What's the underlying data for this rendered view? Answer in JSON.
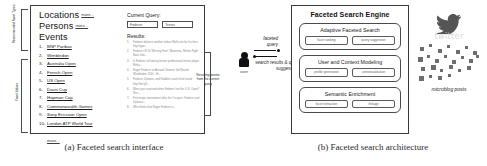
{
  "figure": {
    "caption_a": "(a) Faceted search interface",
    "caption_b": "(b) Faceted search architecture"
  },
  "interface": {
    "annotations": {
      "facet_types": "Recommended Facet Types",
      "facet_values": "Facet Values",
      "results_callout": "Resulting tweets from the current query"
    },
    "facets": [
      {
        "label": "Locations",
        "more": "more..."
      },
      {
        "label": "Persons",
        "more": "more..."
      },
      {
        "label": "Events",
        "more": ""
      }
    ],
    "events": [
      {
        "n": "1-",
        "label": "BNP Paribas"
      },
      {
        "n": "2-",
        "label": "Wimbledon"
      },
      {
        "n": "3-",
        "label": "Australia Open"
      },
      {
        "n": "4-",
        "label": "French Open"
      },
      {
        "n": "5-",
        "label": "US Open"
      },
      {
        "n": "6-",
        "label": "Davis Cup"
      },
      {
        "n": "7-",
        "label": "Hopman Cup"
      },
      {
        "n": "8-",
        "label": "Commonwealth Games"
      },
      {
        "n": "9-",
        "label": "Sony Ericsson Open"
      },
      {
        "n": "10-",
        "label": "London ATP World Tour"
      }
    ],
    "events_more": "more...",
    "query": {
      "title": "Current Query:",
      "chips": [
        "Federer",
        "Tennis"
      ]
    },
    "results": {
      "title": "Results:",
      "items": [
        {
          "n": "1.",
          "text": "Federer delivers another Indian Wells win for his fans http://goo..."
        },
        {
          "n": "2.",
          "text": "Federer Off To Winning Start; Wawrinka, Melzer Fight Back Into..."
        },
        {
          "n": "3.",
          "text": "Is Federer still dating former professional tennis player Mirka..."
        },
        {
          "n": "4.",
          "text": "Roger Federer vs Arnaud Clement 3rd Round. Wimbledon 2010 - Hi..."
        },
        {
          "n": "5.",
          "text": "Federer, Djokovic and Roddick reach third round http://bit.ly/f..."
        },
        {
          "n": "6.",
          "text": "Were you surprised when Federer lost the U.S. Open? Res..."
        },
        {
          "n": "7.",
          "text": "First major tournament after the Oz open: Federer and Djokovic..."
        },
        {
          "n": "8.",
          "text": "Who thinks that Roger Federer is..."
        }
      ]
    }
  },
  "user": {
    "label": "user",
    "arrow_out": "faceted query",
    "arrow_in": "search results & query suggestions"
  },
  "architecture": {
    "title": "Faceted Search Engine",
    "modules": [
      {
        "title": "Adaptive Faceted Search",
        "components": [
          "facet ranking",
          "query suggestion"
        ]
      },
      {
        "title": "User and Context Modeling",
        "components": [
          "profile generation",
          "contextualization"
        ]
      },
      {
        "title": "Semantic Enrichment",
        "components": [
          "facet extraction",
          "linkage"
        ]
      }
    ],
    "source": {
      "brand": "twitter",
      "posts_label": "microblog posts"
    }
  }
}
